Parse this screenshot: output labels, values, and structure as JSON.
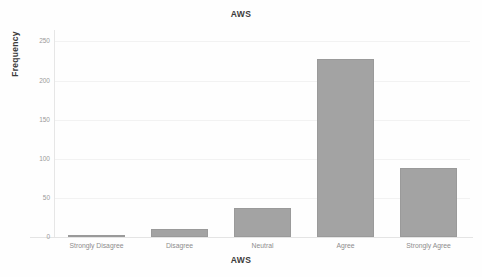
{
  "chart_data": {
    "type": "bar",
    "title": "AWS",
    "xlabel": "AWS",
    "ylabel": "Frequency",
    "categories": [
      "Strongly Disagree",
      "Disagree",
      "Neutral",
      "Agree",
      "Strongly Agree"
    ],
    "values": [
      1,
      10,
      37,
      228,
      88
    ],
    "ylim": [
      0,
      262
    ],
    "yticks": [
      0,
      50,
      100,
      150,
      200,
      250
    ],
    "ytick_labels": [
      "0",
      "50",
      "100",
      "150",
      "200",
      "250"
    ],
    "grid": true,
    "legend": "none",
    "bar_color": "#a3a3a3",
    "bar_edge_color": "#9a9a9a",
    "background_color": "#fefefe",
    "gridline_color": "#f2f2f2",
    "axis_color": "#e4e4e4",
    "tick_label_color": "#9a9a9a",
    "title_color": "#3b3b3b"
  }
}
